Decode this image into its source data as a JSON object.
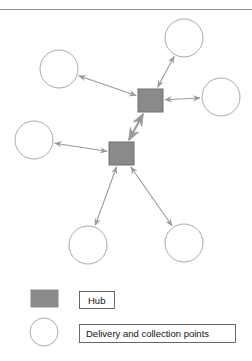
{
  "colors": {
    "hub_fill": "#8a8a8a",
    "hub_stroke": "#707070",
    "node_stroke": "#a8a8a8",
    "arrow": "#9a9a9a",
    "rule": "#8c8c8c"
  },
  "nodes": [
    {
      "id": "hub-1",
      "type": "hub"
    },
    {
      "id": "hub-2",
      "type": "hub"
    },
    {
      "id": "point-top",
      "type": "point"
    },
    {
      "id": "point-upper-left",
      "type": "point"
    },
    {
      "id": "point-right",
      "type": "point"
    },
    {
      "id": "point-lower-left",
      "type": "point"
    },
    {
      "id": "point-bottom-left",
      "type": "point"
    },
    {
      "id": "point-bottom-right",
      "type": "point"
    }
  ],
  "edges": [
    {
      "from": "hub-1",
      "to": "point-top",
      "direction": "both"
    },
    {
      "from": "hub-1",
      "to": "point-upper-left",
      "direction": "both"
    },
    {
      "from": "hub-1",
      "to": "point-right",
      "direction": "both"
    },
    {
      "from": "hub-1",
      "to": "hub-2",
      "direction": "both"
    },
    {
      "from": "hub-2",
      "to": "point-lower-left",
      "direction": "both"
    },
    {
      "from": "hub-2",
      "to": "point-bottom-left",
      "direction": "both"
    },
    {
      "from": "hub-2",
      "to": "point-bottom-right",
      "direction": "both"
    }
  ],
  "legend": {
    "hub_label": "Hub",
    "point_label": "Delivery and collection points"
  }
}
